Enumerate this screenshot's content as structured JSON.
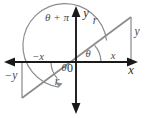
{
  "diagram": {
    "type": "geometry-diagram",
    "colors": {
      "axis": "#1a1a1a",
      "ray": "#8c8c8c",
      "triangle_leg": "#9a9a9a",
      "arc": "#8c8c8c",
      "label_gray": "#4a4a4a",
      "label_dark": "#2b2b2b",
      "background": "#ffffff"
    },
    "origin_label": "0",
    "axes": {
      "x_positive_label": "x",
      "y_positive_label": "y"
    },
    "labels": {
      "angle_theta_q1": "θ",
      "angle_theta_q3": "θ",
      "angle_theta_plus_pi": "θ + π",
      "radius_q1": "r",
      "radius_q3": "r",
      "leg_x_positive": "x",
      "leg_y_positive": "y",
      "leg_x_negative": "−x",
      "leg_y_negative": "−y"
    },
    "geometry": {
      "origin": {
        "x": 76,
        "y": 62
      },
      "x_axis": {
        "x1": 4,
        "y1": 62,
        "x2": 138,
        "y2": 62
      },
      "y_axis": {
        "x1": 76,
        "y1": 8,
        "x2": 76,
        "y2": 112
      },
      "ray_q1_end": {
        "x": 131,
        "y": 17
      },
      "ray_q3_end": {
        "x": 22,
        "y": 98
      },
      "triangle_q1_foot": {
        "x": 131,
        "y": 62
      },
      "triangle_q3_foot": {
        "x": 22,
        "y": 62
      },
      "arc_small_radius": 22,
      "arc_large_radius": 40
    }
  }
}
